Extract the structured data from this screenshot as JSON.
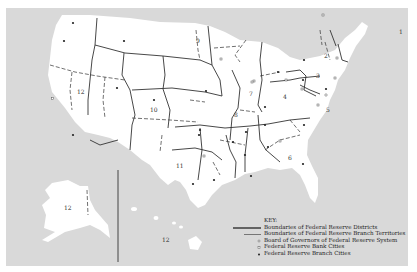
{
  "map": {
    "title": "Federal Reserve Districts",
    "background_color": "#d9d9d9",
    "land_color": "#ffffff",
    "boundary_color": "#333333",
    "district_labels": [
      {
        "id": "1",
        "x": 399,
        "y": 34
      },
      {
        "id": "2",
        "x": 324,
        "y": 58
      },
      {
        "id": "3",
        "x": 316,
        "y": 78
      },
      {
        "id": "4",
        "x": 283,
        "y": 99
      },
      {
        "id": "5",
        "x": 326,
        "y": 112
      },
      {
        "id": "6",
        "x": 288,
        "y": 160
      },
      {
        "id": "7",
        "x": 249,
        "y": 96
      },
      {
        "id": "8",
        "x": 234,
        "y": 117
      },
      {
        "id": "9",
        "x": 196,
        "y": 43
      },
      {
        "id": "10",
        "x": 153,
        "y": 112
      },
      {
        "id": "11",
        "x": 179,
        "y": 168
      },
      {
        "id": "12",
        "x": 81,
        "y": 94
      },
      {
        "id": "12",
        "x": 67,
        "y": 210
      },
      {
        "id": "12",
        "x": 165,
        "y": 242
      }
    ]
  },
  "key": {
    "title": "KEY:",
    "items": [
      {
        "symbol": "thick-line",
        "label": "Boundaries of Federal Reserve Districts"
      },
      {
        "symbol": "thin-line",
        "label": "Boundaries of Federal Reserve Branch Territories"
      },
      {
        "symbol": "circle",
        "label": "Board of Governors of Federal Reserve System"
      },
      {
        "symbol": "square",
        "label": "Federal Reserve Bank Cities"
      },
      {
        "symbol": "dot",
        "label": "Federal Reserve Branch Cities"
      }
    ]
  }
}
